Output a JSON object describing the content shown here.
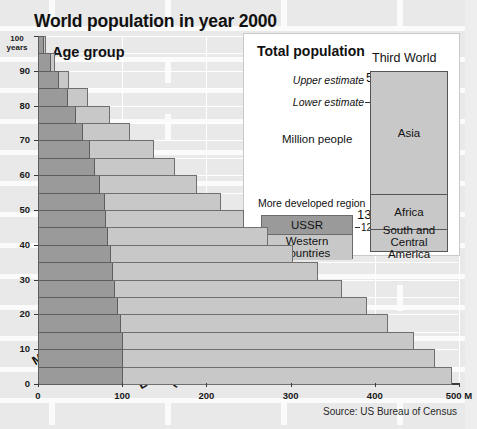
{
  "title": "World population in year 2000",
  "source": "Source: US Bureau of Census",
  "chart": {
    "age_group_label": "Age group",
    "y_unit_label": "100\nyears",
    "y_top_value": "100",
    "y_top_unit": "years",
    "x_unit_suffix": "M",
    "more_developed_label": "More\ndeveloped region",
    "more_developed_line1": "More",
    "more_developed_line2": "developed region",
    "less_developed_line1": "Less developed region",
    "less_developed_line2": "(Third World)"
  },
  "inset": {
    "title": "Total population",
    "upper_estimate_label": "Upper estimate",
    "upper_estimate_value": "5500",
    "lower_estimate_label": "Lower estimate",
    "lower_estimate_value": "4700",
    "unit_label": "Million people",
    "more_developed_region_label": "More developed region",
    "more_developed_upper": "1300",
    "more_developed_lower": "1200",
    "legend_ussr": "USSR",
    "legend_western_line1": "Western",
    "legend_western_line2": "countries",
    "third_world_title": "Third World",
    "segments": [
      {
        "name": "Asia",
        "label": "Asia"
      },
      {
        "name": "Africa",
        "label": "Africa"
      },
      {
        "name": "South and Central America",
        "label_line1": "South and",
        "label_line2": "Central America"
      }
    ]
  },
  "colors": {
    "more_developed": "#9a9a9a",
    "less_developed": "#c8c8c8",
    "background": "#f2f2f2",
    "inset_background": "#ffffff",
    "axis": "#3a3a3a",
    "text": "#111111"
  },
  "chart_data": {
    "type": "bar",
    "title": "World population in year 2000",
    "xlabel": "Million people",
    "ylabel": "Age group (years)",
    "xlim": [
      0,
      500
    ],
    "ylim": [
      0,
      100
    ],
    "xticks": [
      "0",
      "100",
      "200",
      "300",
      "400",
      "500 M"
    ],
    "xtick_values": [
      0,
      100,
      200,
      300,
      400,
      500
    ],
    "yticks": [
      "0",
      "10",
      "20",
      "30",
      "40",
      "50",
      "60",
      "70",
      "80",
      "90",
      "100"
    ],
    "ytick_values": [
      0,
      10,
      20,
      30,
      40,
      50,
      60,
      70,
      80,
      90,
      100
    ],
    "orientation": "horizontal",
    "stacked": true,
    "grid": true,
    "legend_position": "in-chart-rotated-labels",
    "age_bands": [
      "0-5",
      "5-10",
      "10-15",
      "15-20",
      "20-25",
      "25-30",
      "30-35",
      "35-40",
      "40-45",
      "45-50",
      "50-55",
      "55-60",
      "60-65",
      "65-70",
      "70-75",
      "75-80",
      "80-85",
      "85-90",
      "90-95",
      "95-100"
    ],
    "series": [
      {
        "name": "More developed region",
        "color": "#9a9a9a",
        "values": [
          100,
          100,
          100,
          97,
          94,
          90,
          88,
          86,
          82,
          80,
          78,
          72,
          66,
          60,
          52,
          44,
          34,
          24,
          14,
          6
        ]
      },
      {
        "name": "Less developed region (Third World)",
        "color": "#c8c8c8",
        "values": [
          390,
          370,
          345,
          318,
          295,
          270,
          243,
          216,
          190,
          164,
          138,
          116,
          96,
          76,
          56,
          40,
          24,
          12,
          5,
          2
        ]
      }
    ],
    "totals": [
      490,
      470,
      445,
      415,
      389,
      360,
      331,
      302,
      272,
      244,
      216,
      188,
      162,
      136,
      108,
      84,
      58,
      36,
      19,
      8
    ]
  },
  "inset_chart_data": {
    "type": "bar",
    "title": "Total population",
    "unit": "Million people",
    "bars": [
      {
        "name": "More developed region",
        "upper_estimate": 1300,
        "lower_estimate": 1200,
        "segments": [
          {
            "name": "USSR",
            "color": "#9a9a9a"
          },
          {
            "name": "Western countries",
            "color": "#c8c8c8"
          }
        ]
      },
      {
        "name": "Third World",
        "upper_estimate": 5500,
        "lower_estimate": 4700,
        "segments": [
          {
            "name": "Asia",
            "color": "#c8c8c8"
          },
          {
            "name": "Africa",
            "color": "#c8c8c8"
          },
          {
            "name": "South and Central America",
            "color": "#c8c8c8"
          }
        ]
      }
    ]
  }
}
